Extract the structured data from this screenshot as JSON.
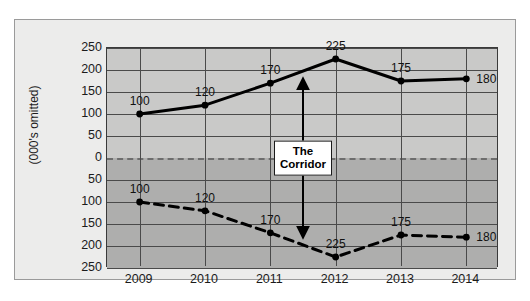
{
  "chart_data": {
    "type": "line",
    "title": "",
    "xlabel": "",
    "ylabel": "(000's omitted)",
    "categories": [
      "2009",
      "2010",
      "2011",
      "2012",
      "2013",
      "2014"
    ],
    "series": [
      {
        "name": "upper-corridor-boundary",
        "style": "solid",
        "values": [
          100,
          120,
          170,
          225,
          175,
          180
        ],
        "labels": [
          "100",
          "120",
          "170",
          "225",
          "175",
          "180"
        ]
      },
      {
        "name": "lower-corridor-boundary",
        "style": "dashed",
        "values": [
          -100,
          -120,
          -170,
          -225,
          -175,
          -180
        ],
        "labels": [
          "100",
          "120",
          "170",
          "225",
          "175",
          "180"
        ]
      }
    ],
    "ylim": [
      -250,
      250
    ],
    "y_ticks": [
      250,
      200,
      150,
      100,
      50,
      0,
      50,
      100,
      150,
      200,
      250
    ],
    "y_tick_labels": [
      "250",
      "200",
      "150",
      "100",
      "50",
      "0",
      "50",
      "100",
      "150",
      "200",
      "250"
    ],
    "grid": true,
    "legend": "none",
    "zero_line": "dashed",
    "annotations": [
      {
        "name": "corridor-arrow",
        "label": "The Corridor",
        "label_line_1": "The",
        "label_line_2": "Corridor",
        "x_position": "2011.5",
        "arrow": "double-headed-vertical",
        "from_value": 170,
        "to_value": -170
      }
    ],
    "colors": {
      "upper_band": "#c9c9c8",
      "lower_band": "#aeaead",
      "line": "#000000",
      "grid": "#4a4a4a",
      "zero_line": "#6d6d6d",
      "panel": "#ececeb",
      "panel_border": "#9a9a9a",
      "text": "#1b1b1b"
    }
  }
}
